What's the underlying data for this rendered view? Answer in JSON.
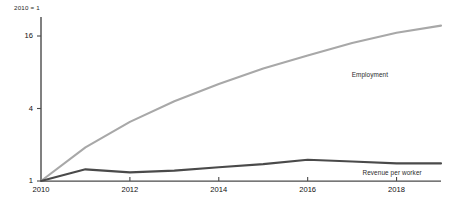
{
  "chart_data": {
    "type": "line",
    "title": "",
    "subtitle": "",
    "unit_note": "2010 = 1",
    "xlabel": "",
    "ylabel": "",
    "yscale": "log",
    "ylim": [
      1,
      24
    ],
    "xlim": [
      2010,
      2019
    ],
    "grid": false,
    "legend_position": "inline-right",
    "ytick_labels": [
      "1",
      "4",
      "16"
    ],
    "ytick_values": [
      1,
      4,
      16
    ],
    "xtick_labels": [
      "2010",
      "2012",
      "2014",
      "2016",
      "2018"
    ],
    "xtick_values": [
      2010,
      2012,
      2014,
      2016,
      2018
    ],
    "x": [
      2010,
      2011,
      2012,
      2013,
      2014,
      2015,
      2016,
      2017,
      2018,
      2019
    ],
    "series": [
      {
        "name": "Employment",
        "color": "#a8a8a8",
        "values": [
          1.0,
          1.9,
          3.1,
          4.6,
          6.4,
          8.6,
          11.0,
          14.0,
          17.0,
          19.5
        ]
      },
      {
        "name": "Revenue per worker",
        "color": "#4a4a4a",
        "values": [
          1.0,
          1.25,
          1.18,
          1.22,
          1.3,
          1.38,
          1.5,
          1.45,
          1.4,
          1.4
        ]
      }
    ],
    "annotations": [
      {
        "text": "Employment",
        "x": 2017.4,
        "y": 7.6
      },
      {
        "text": "Revenue per worker",
        "x": 2017.9,
        "y": 1.17
      }
    ],
    "colors": {
      "axis": "#4a4a4a",
      "employment": "#a8a8a8",
      "revenue_per_worker": "#4a4a4a",
      "text": "#111111",
      "background": "#ffffff"
    }
  }
}
